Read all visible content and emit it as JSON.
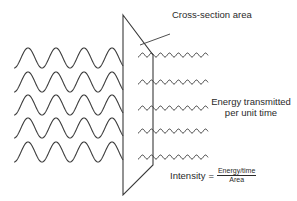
{
  "diagram": {
    "labels": {
      "cross_section": "Cross-section area",
      "energy_line1": "Energy transmitted",
      "energy_line2": "per unit time"
    },
    "formula": {
      "lhs": "Intensity",
      "equals": "=",
      "numerator": "Energy/time",
      "denominator": "Area"
    },
    "incident_waves": {
      "count": 5,
      "y_centers": [
        58,
        82,
        105,
        128,
        152
      ],
      "x_start": 14,
      "x_end": 123,
      "amplitude": 10,
      "period": 28
    },
    "transmitted_waves": {
      "count": 5,
      "y_centers": [
        55,
        82,
        108,
        131,
        157
      ],
      "x_start": 138,
      "x_end": 208,
      "amplitude": 2,
      "period": 9
    },
    "surface": {
      "shape": "parallelogram",
      "points": [
        [
          123,
          15
        ],
        [
          153,
          55
        ],
        [
          153,
          165
        ],
        [
          123,
          195
        ]
      ]
    },
    "stroke_color": "#3a3a3a"
  }
}
